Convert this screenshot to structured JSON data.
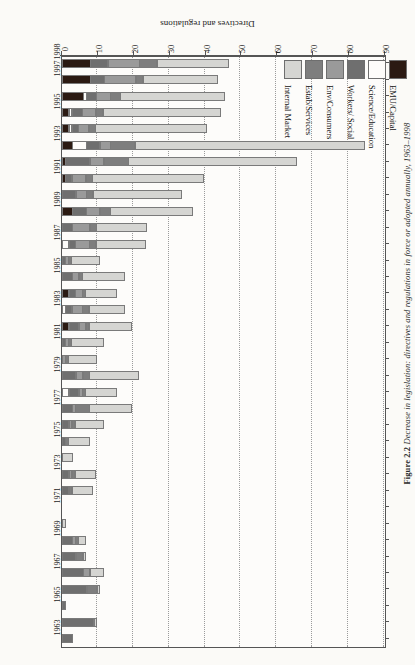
{
  "figure": {
    "caption_label": "Figure 2.2",
    "caption_text": "Decrease in legislation: directives and regulations in force or adopted annually, 1963–1998"
  },
  "axes": {
    "value_axis_title": "Directives and regulations",
    "value_ticks": [
      0,
      10,
      20,
      30,
      40,
      50,
      60,
      70,
      80,
      90
    ],
    "value_min": 0,
    "value_max": 90,
    "category_axis_title": "",
    "category_label_interval": 2
  },
  "legend": {
    "position": "bottom-left",
    "items": [
      {
        "label": "EMU/Capital",
        "color": "#2b1a12"
      },
      {
        "label": "Science/Education",
        "color": "#fdfcfa"
      },
      {
        "label": "Workers/ Social",
        "color": "#6f6f6f"
      },
      {
        "label": "Env/Consumers",
        "color": "#9a9a9a"
      },
      {
        "label": "Estab/Services",
        "color": "#7e7e7e"
      },
      {
        "label": "Internal Market",
        "color": "#d5d5d2"
      }
    ]
  },
  "chart_data": {
    "type": "bar",
    "orientation": "horizontal-stacked",
    "title": "Decrease in legislation: directives and regulations in force or adopted annually, 1963–1998",
    "xlabel": "Directives and regulations",
    "ylabel": "",
    "xlim": [
      0,
      90
    ],
    "grid": true,
    "legend_position": "bottom-left",
    "categories": [
      "1963",
      "1964",
      "1965",
      "1966",
      "1967",
      "1968",
      "1969",
      "1970",
      "1971",
      "1972",
      "1973",
      "1974",
      "1975",
      "1976",
      "1977",
      "1978",
      "1979",
      "1980",
      "1981",
      "1982",
      "1983",
      "1984",
      "1985",
      "1986",
      "1987",
      "1988",
      "1989",
      "1990",
      "1991",
      "1992",
      "1993",
      "1994",
      "1995",
      "1996",
      "1997",
      "1998"
    ],
    "tick_labels": [
      "1963",
      "1965",
      "1967",
      "1969",
      "1971",
      "1973",
      "1975",
      "1977",
      "1979",
      "1981",
      "1983",
      "1985",
      "1987",
      "1989",
      "1991",
      "1993",
      "1995",
      "1997",
      "1998"
    ],
    "series": [
      {
        "name": "EMU/Capital",
        "color": "#2b1a12",
        "values": [
          0,
          0,
          0,
          0,
          0,
          0,
          0,
          0,
          0,
          0,
          0,
          0,
          0,
          0,
          0,
          0,
          0,
          0,
          0,
          2,
          0,
          2,
          0,
          0,
          0,
          0,
          3,
          0,
          1,
          1,
          3,
          2,
          2,
          6,
          8,
          8
        ]
      },
      {
        "name": "Science/Education",
        "color": "#fdfcfa",
        "values": [
          0,
          0,
          0,
          0,
          0,
          0,
          0,
          0,
          0,
          0,
          0,
          0,
          0,
          0,
          0,
          2,
          0,
          0,
          0,
          0,
          1,
          0,
          0,
          0,
          2,
          0,
          0,
          0,
          0,
          0,
          4,
          1,
          1,
          1,
          0,
          0
        ]
      },
      {
        "name": "Workers/ Social",
        "color": "#6f6f6f",
        "values": [
          3,
          9,
          1,
          7,
          6,
          4,
          3,
          0,
          0,
          2,
          2,
          0,
          1,
          2,
          3,
          3,
          4,
          0,
          1,
          3,
          2,
          2,
          3,
          1,
          2,
          3,
          4,
          4,
          2,
          7,
          4,
          2,
          3,
          3,
          4,
          5
        ]
      },
      {
        "name": "Env/Consumers",
        "color": "#9a9a9a",
        "values": [
          0,
          0,
          0,
          0,
          2,
          0,
          1,
          0,
          0,
          0,
          1,
          0,
          0,
          1,
          1,
          1,
          2,
          1,
          1,
          2,
          3,
          2,
          2,
          1,
          4,
          5,
          4,
          3,
          4,
          4,
          3,
          3,
          4,
          4,
          9,
          9
        ]
      },
      {
        "name": "Estab/Services",
        "color": "#7e7e7e",
        "values": [
          0,
          0,
          0,
          3,
          0,
          2,
          1,
          0,
          0,
          1,
          1,
          0,
          1,
          1,
          4,
          1,
          2,
          1,
          1,
          1,
          2,
          1,
          1,
          1,
          2,
          2,
          3,
          2,
          2,
          7,
          7,
          2,
          2,
          3,
          2,
          5
        ]
      },
      {
        "name": "Internal Market",
        "color": "#d5d5d2",
        "values": [
          0,
          1,
          0,
          1,
          4,
          1,
          2,
          1,
          0,
          6,
          6,
          3,
          6,
          8,
          12,
          9,
          14,
          8,
          9,
          12,
          10,
          9,
          12,
          8,
          14,
          14,
          23,
          25,
          31,
          47,
          64,
          31,
          33,
          29,
          21,
          20
        ]
      }
    ],
    "totals": [
      3,
      10,
      1,
      11,
      12,
      7,
      7,
      1,
      0,
      9,
      10,
      3,
      8,
      12,
      20,
      16,
      22,
      10,
      12,
      20,
      18,
      16,
      18,
      11,
      24,
      24,
      37,
      34,
      40,
      68,
      85,
      41,
      45,
      46,
      44,
      47
    ]
  }
}
